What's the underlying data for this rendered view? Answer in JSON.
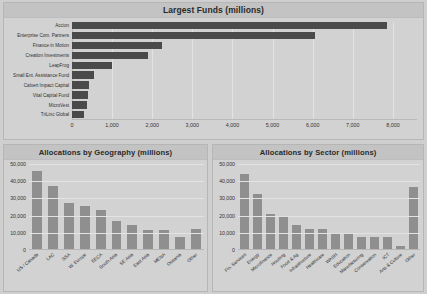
{
  "panels": {
    "funds": {
      "title": "Largest Funds (millions)"
    },
    "geography": {
      "title": "Allocations by Geography (millions)"
    },
    "sector": {
      "title": "Allocations by Sector (millions)"
    }
  },
  "colors": {
    "page_background": "#cfcfcf",
    "panel_background": "#d2d2d2",
    "panel_header": "#c3c3c3",
    "horizontal_bar": "#4a4a4a",
    "vertical_bar": "#8f8f8f",
    "gridline": "#e2e2e2",
    "text": "#2e2e2e"
  },
  "chart_data": [
    {
      "type": "bar",
      "orientation": "horizontal",
      "title": "Largest Funds (millions)",
      "xlabel": "",
      "ylabel": "",
      "xlim": [
        0,
        8600
      ],
      "grid": true,
      "xticks": [
        "0",
        "1,000",
        "2,000",
        "3,000",
        "4,000",
        "5,000",
        "6,000",
        "7,000",
        "8,000"
      ],
      "xtick_values": [
        0,
        1000,
        2000,
        3000,
        4000,
        5000,
        6000,
        7000,
        8000
      ],
      "categories": [
        "Accion",
        "Enterprise Com. Partners",
        "Finance in Motion",
        "Creation Investments",
        "LeapFrog",
        "Small Ent. Assistance Fund",
        "Calvert Impact Capital",
        "Vital Capital Fund",
        "MicroVest",
        "TriLinc Global"
      ],
      "values": [
        7850,
        6050,
        2250,
        1900,
        1000,
        540,
        430,
        400,
        370,
        300
      ]
    },
    {
      "type": "bar",
      "orientation": "vertical",
      "title": "Allocations by Geography (millions)",
      "xlabel": "",
      "ylabel": "",
      "ylim": [
        0,
        50000
      ],
      "grid": true,
      "yticks": [
        "0",
        "10,000",
        "20,000",
        "30,000",
        "40,000",
        "50,000"
      ],
      "ytick_values": [
        0,
        10000,
        20000,
        30000,
        40000,
        50000
      ],
      "categories": [
        "US / Canada",
        "LAC",
        "SSA",
        "W. Europe",
        "EECA",
        "South Asia",
        "SE Asia",
        "East Asia",
        "MENA",
        "Oceania",
        "Other"
      ],
      "values": [
        45500,
        36500,
        27000,
        25000,
        22800,
        16000,
        13800,
        11300,
        11300,
        7000,
        11400
      ]
    },
    {
      "type": "bar",
      "orientation": "vertical",
      "title": "Allocations by Sector (millions)",
      "xlabel": "",
      "ylabel": "",
      "ylim": [
        0,
        50000
      ],
      "grid": true,
      "yticks": [
        "0",
        "10,000",
        "20,000",
        "30,000",
        "40,000",
        "50,000"
      ],
      "ytick_values": [
        0,
        10000,
        20000,
        30000,
        40000,
        50000
      ],
      "categories": [
        "Fin. Services",
        "Energy",
        "Microfinance",
        "Housing",
        "Food & Ag",
        "Infrastructure",
        "Healthcare",
        "WASH",
        "Education",
        "Manufacturing",
        "Conservation",
        "ICT",
        "Arts & Culture",
        "Other"
      ],
      "values": [
        43500,
        32000,
        20500,
        18500,
        14000,
        11500,
        11500,
        9200,
        9200,
        7000,
        7000,
        7000,
        1800,
        36000
      ]
    }
  ]
}
